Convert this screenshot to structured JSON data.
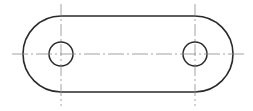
{
  "figure": {
    "type": "technical-drawing",
    "colors": {
      "outline": "#2a2a2a",
      "centerline": "#8a8a8a",
      "background": "#ffffff"
    },
    "outline": {
      "left_arc_center": [
        61,
        54
      ],
      "right_arc_center": [
        195,
        54
      ],
      "radius": 38
    },
    "holes": [
      {
        "name": "left-hole",
        "cx": 61,
        "cy": 54,
        "r": 12
      },
      {
        "name": "right-hole",
        "cx": 195,
        "cy": 54,
        "r": 12
      }
    ],
    "centerlines": {
      "horizontal": {
        "x1": 12,
        "x2": 244,
        "y": 54
      },
      "vertical": [
        {
          "x": 61,
          "y1": 4,
          "y2": 106
        },
        {
          "x": 195,
          "y1": 4,
          "y2": 106
        }
      ]
    }
  }
}
